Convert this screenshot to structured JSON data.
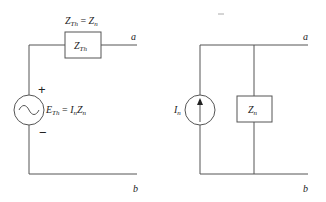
{
  "left_circuit": {
    "title": "Thevenin equivalent",
    "impedance_equation": {
      "lhs_main": "Z",
      "lhs_sub": "Th",
      "eq": " = ",
      "rhs_main": "Z",
      "rhs_sub": "n"
    },
    "impedance_box": {
      "main": "Z",
      "sub": "Th"
    },
    "source_label": {
      "e_main": "E",
      "e_sub": "Th",
      "eq": " = ",
      "i_main": "I",
      "i_sub": "n",
      "z_main": "Z",
      "z_sub": "n"
    },
    "plus": "+",
    "minus": "−",
    "terminal_a": "a",
    "terminal_b": "b",
    "source_symbol": "ac-voltage-source"
  },
  "right_circuit": {
    "title": "Norton equivalent",
    "source_label": {
      "main": "I",
      "sub": "n"
    },
    "impedance_box": {
      "main": "Z",
      "sub": "n"
    },
    "terminal_a": "a",
    "terminal_b": "b",
    "source_symbol": "current-source-arrow-up"
  },
  "colors": {
    "wire": "#555555",
    "text": "#222222",
    "background": "#ffffff"
  }
}
